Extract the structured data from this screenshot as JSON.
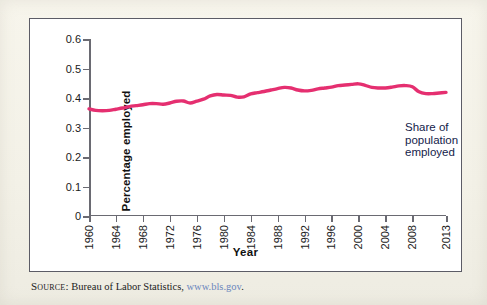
{
  "figure": {
    "background_color": "#ffffff",
    "page_color": "#f5f3ea",
    "border_color": "#5c5c66"
  },
  "axes": {
    "y_title": "Percentage employed",
    "x_title": "Year",
    "y_ticks": [
      "0",
      "0.1",
      "0.2",
      "0.3",
      "0.4",
      "0.5",
      "0.6"
    ],
    "x_ticks": [
      "1960",
      "1964",
      "1968",
      "1972",
      "1976",
      "1980",
      "1984",
      "1988",
      "1992",
      "1996",
      "2000",
      "2004",
      "2008",
      "2013"
    ]
  },
  "annotation": {
    "series_label": "Share of population\nemployed",
    "color": "#14224a"
  },
  "source": {
    "label": "Source:",
    "text": " Bureau of Labor Statistics, ",
    "url": "www.bls.gov",
    "trailing": ".",
    "url_color": "#6b86bd"
  },
  "chart_data": {
    "type": "line",
    "title": "",
    "subtitle": "",
    "xlabel": "Year",
    "ylabel": "Percentage employed",
    "xlim": [
      1960,
      2013
    ],
    "ylim": [
      0,
      0.6
    ],
    "ytick_values": [
      0,
      0.1,
      0.2,
      0.3,
      0.4,
      0.5,
      0.6
    ],
    "xtick_values": [
      1960,
      1964,
      1968,
      1972,
      1976,
      1980,
      1984,
      1988,
      1992,
      1996,
      2000,
      2004,
      2008,
      2013
    ],
    "grid": false,
    "legend": "none",
    "annotations": [
      {
        "text": "Share of population employed",
        "x": 1996,
        "y": 0.425
      }
    ],
    "series": [
      {
        "name": "Share of population employed",
        "color": "#e52f70",
        "line_width": 3.4,
        "x": [
          1960,
          1961,
          1962,
          1963,
          1964,
          1965,
          1966,
          1967,
          1968,
          1969,
          1970,
          1971,
          1972,
          1973,
          1974,
          1975,
          1976,
          1977,
          1978,
          1979,
          1980,
          1981,
          1982,
          1983,
          1984,
          1985,
          1986,
          1987,
          1988,
          1989,
          1990,
          1991,
          1992,
          1993,
          1994,
          1995,
          1996,
          1997,
          1998,
          1999,
          2000,
          2001,
          2002,
          2003,
          2004,
          2005,
          2006,
          2007,
          2008,
          2009,
          2010,
          2011,
          2012,
          2013
        ],
        "values": [
          0.363,
          0.358,
          0.357,
          0.358,
          0.362,
          0.366,
          0.371,
          0.374,
          0.377,
          0.381,
          0.381,
          0.379,
          0.383,
          0.389,
          0.39,
          0.383,
          0.389,
          0.396,
          0.407,
          0.412,
          0.41,
          0.409,
          0.403,
          0.404,
          0.414,
          0.418,
          0.422,
          0.427,
          0.432,
          0.436,
          0.434,
          0.427,
          0.424,
          0.426,
          0.431,
          0.434,
          0.437,
          0.442,
          0.444,
          0.446,
          0.448,
          0.443,
          0.436,
          0.434,
          0.434,
          0.437,
          0.441,
          0.442,
          0.438,
          0.421,
          0.415,
          0.415,
          0.417,
          0.419
        ]
      }
    ]
  }
}
